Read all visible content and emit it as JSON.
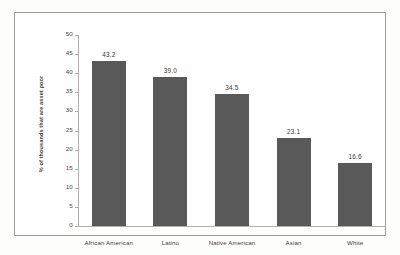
{
  "chart_data": {
    "type": "bar",
    "title": "",
    "xlabel": "",
    "ylabel": "% of thousands that are asset poor",
    "categories": [
      "African American",
      "Latino",
      "Native American",
      "Asian",
      "White"
    ],
    "values": [
      43.2,
      39.0,
      34.5,
      23.1,
      16.6
    ],
    "value_labels": [
      "43.2",
      "39.0",
      "34.5",
      "23.1",
      "16.6"
    ],
    "ylim": [
      0,
      50
    ],
    "ytick_labels": [
      "50",
      "45",
      "40",
      "35",
      "30",
      "25",
      "20",
      "15",
      "10",
      "5",
      "0"
    ],
    "ytick_values": [
      50,
      45,
      40,
      35,
      30,
      25,
      20,
      15,
      10,
      5,
      0
    ],
    "grid": false,
    "legend": false,
    "bar_color": "#595959",
    "axis_color": "#b0b0ac",
    "text_color": "#3d3d3b",
    "background": "#fefefe"
  }
}
